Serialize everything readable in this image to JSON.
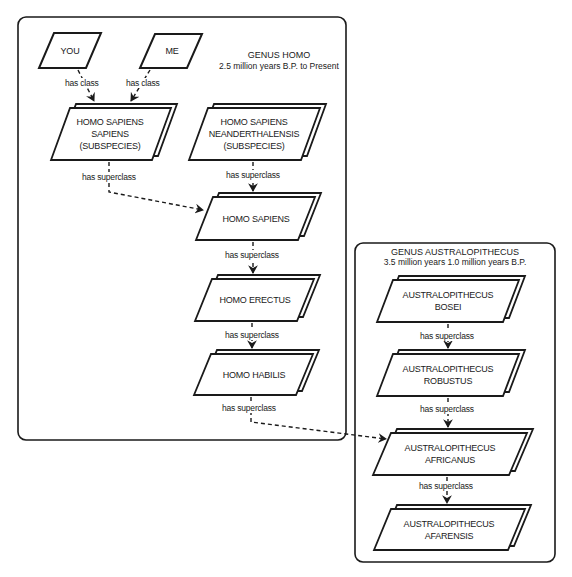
{
  "genera": {
    "homo": {
      "title": "GENUS HOMO",
      "subtitle": "2.5 million years B.P. to Present"
    },
    "australopithecus": {
      "title": "GENUS AUSTRALOPITHECUS",
      "subtitle": "3.5 million years 1.0 million years B.P."
    }
  },
  "nodes": {
    "you": {
      "lines": [
        "YOU"
      ]
    },
    "me": {
      "lines": [
        "ME"
      ]
    },
    "homo_sapiens_sapiens": {
      "lines": [
        "HOMO SAPIENS",
        "SAPIENS",
        "(SUBSPECIES)"
      ]
    },
    "homo_sapiens_neanderthalensis": {
      "lines": [
        "HOMO SAPIENS",
        "NEANDERTHALENSIS",
        "(SUBSPECIES)"
      ]
    },
    "homo_sapiens": {
      "lines": [
        "HOMO SAPIENS"
      ]
    },
    "homo_erectus": {
      "lines": [
        "HOMO ERECTUS"
      ]
    },
    "homo_habilis": {
      "lines": [
        "HOMO HABILIS"
      ]
    },
    "australopithecus_bosei": {
      "lines": [
        "AUSTRALOPITHECUS",
        "BOSEI"
      ]
    },
    "australopithecus_robustus": {
      "lines": [
        "AUSTRALOPITHECUS",
        "ROBUSTUS"
      ]
    },
    "australopithecus_africanus": {
      "lines": [
        "AUSTRALOPITHECUS",
        "AFRICANUS"
      ]
    },
    "australopithecus_afarensis": {
      "lines": [
        "AUSTRALOPITHECUS",
        "AFARENSIS"
      ]
    }
  },
  "edges": {
    "you_to_hss": "has class",
    "me_to_hss": "has class",
    "hss_to_hs": "has superclass",
    "hsn_to_hs": "has superclass",
    "hs_to_he": "has superclass",
    "he_to_hh": "has superclass",
    "hh_to_afr": "has superclass",
    "bos_to_rob": "has superclass",
    "rob_to_afr": "has superclass",
    "afr_to_afa": "has superclass"
  }
}
